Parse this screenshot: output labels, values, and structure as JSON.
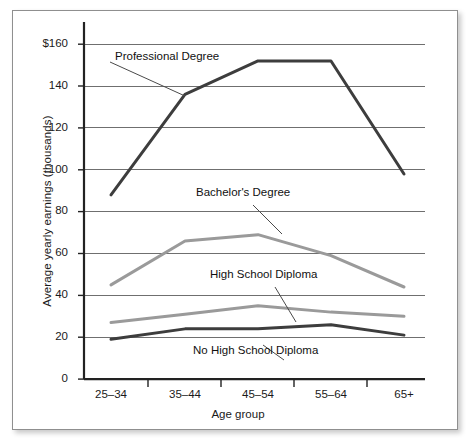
{
  "chart_data": {
    "type": "line",
    "title": "",
    "xlabel": "Age group",
    "ylabel": "Average yearly earnings (thousands)",
    "categories": [
      "25–34",
      "35–44",
      "45–54",
      "55–64",
      "65+"
    ],
    "ylim": [
      0,
      170
    ],
    "yticks": [
      0,
      20,
      40,
      60,
      80,
      100,
      120,
      140,
      160
    ],
    "ytick_labels": [
      "0",
      "20",
      "40",
      "60",
      "80",
      "100",
      "120",
      "140",
      "$160"
    ],
    "grid": "horizontal",
    "legend_position": "inline-annotations",
    "series": [
      {
        "name": "Professional Degree",
        "color": "#3d3d3d",
        "values": [
          88,
          136,
          152,
          152,
          98
        ]
      },
      {
        "name": "Bachelor's Degree",
        "color": "#9a9a9a",
        "values": [
          45,
          66,
          69,
          59,
          44
        ]
      },
      {
        "name": "High School Diploma",
        "color": "#9a9a9a",
        "values": [
          27,
          31,
          35,
          32,
          30
        ]
      },
      {
        "name": "No High School Diploma",
        "color": "#3d3d3d",
        "values": [
          19,
          24,
          24,
          26,
          21
        ]
      }
    ],
    "annotations": [
      {
        "text": "Professional Degree",
        "series": "Professional Degree"
      },
      {
        "text": "Bachelor's Degree",
        "series": "Bachelor's Degree"
      },
      {
        "text": "High School Diploma",
        "series": "High School Diploma"
      },
      {
        "text": "No High School Diploma",
        "series": "No High School Diploma"
      }
    ]
  },
  "axis": {
    "y_label": "Average yearly earnings (thousands)",
    "x_label": "Age group",
    "y_ticks": [
      "$160",
      "140",
      "120",
      "100",
      "80",
      "60",
      "40",
      "20",
      "0"
    ],
    "x_ticks": [
      "25–34",
      "35–44",
      "45–54",
      "55–64",
      "65+"
    ]
  },
  "annotations": {
    "professional": "Professional Degree",
    "bachelors": "Bachelor's Degree",
    "highschool": "High School Diploma",
    "nohighschool": "No High School Diploma"
  },
  "colors": {
    "dark_line": "#3d3d3d",
    "gray_line": "#9a9a9a",
    "gridline": "#6f6f6f",
    "axis": "#222222",
    "frame": "#8f8f8f",
    "text": "#1a1a1a"
  }
}
